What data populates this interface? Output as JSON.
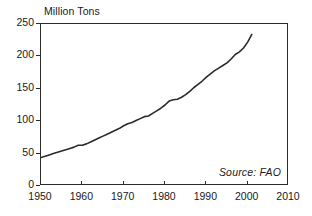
{
  "chart_data": {
    "type": "line",
    "title": "Million Tons",
    "xlabel": "",
    "ylabel": "Million Tons",
    "xlim": [
      1950,
      2010
    ],
    "ylim": [
      0,
      250
    ],
    "grid": false,
    "legend": null,
    "annotations": [
      {
        "name": "source",
        "text": "Source:  FAO",
        "position": "bottom-right-inside"
      }
    ],
    "xticks": [
      1950,
      1960,
      1970,
      1980,
      1990,
      2000,
      2010
    ],
    "xtick_labels": [
      "1950",
      "1960",
      "1970",
      "1980",
      "1990",
      "2000",
      "2010"
    ],
    "yticks": [
      0,
      50,
      100,
      150,
      200,
      250
    ],
    "ytick_labels": [
      "0",
      "50",
      "100",
      "150",
      "200",
      "250"
    ],
    "line_color": "#2b2b2b",
    "series": [
      {
        "name": "World Production",
        "x": [
          1950,
          1951,
          1952,
          1953,
          1954,
          1955,
          1956,
          1957,
          1958,
          1959,
          1960,
          1961,
          1962,
          1963,
          1964,
          1965,
          1966,
          1967,
          1968,
          1969,
          1970,
          1971,
          1972,
          1973,
          1974,
          1975,
          1976,
          1977,
          1978,
          1979,
          1980,
          1981,
          1982,
          1983,
          1984,
          1985,
          1986,
          1987,
          1988,
          1989,
          1990,
          1991,
          1992,
          1993,
          1994,
          1995,
          1996,
          1997,
          1998,
          1999,
          2000,
          2001
        ],
        "values": [
          44,
          46,
          48,
          50,
          52,
          54,
          56,
          58,
          60,
          63,
          63,
          65,
          68,
          71,
          74,
          77,
          80,
          83,
          86,
          89,
          93,
          96,
          98,
          101,
          104,
          107,
          108,
          112,
          116,
          120,
          125,
          131,
          133,
          134,
          137,
          141,
          146,
          152,
          157,
          162,
          168,
          173,
          178,
          182,
          186,
          190,
          196,
          203,
          207,
          213,
          222,
          234
        ]
      }
    ]
  }
}
